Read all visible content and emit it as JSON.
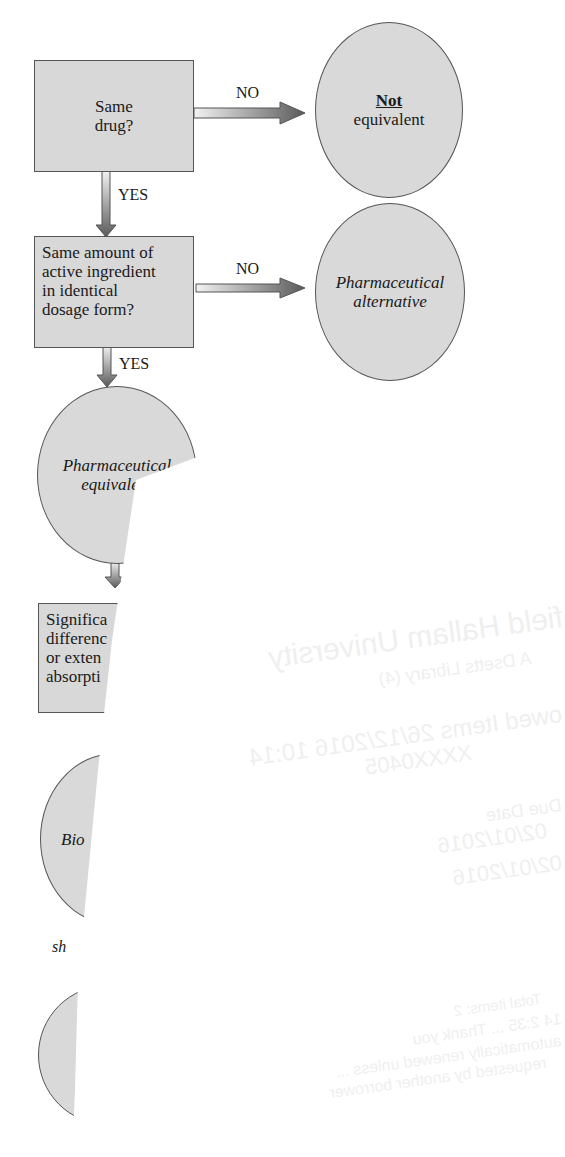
{
  "flowchart": {
    "nodes": {
      "q1": {
        "line1": "Same",
        "line2": "drug?"
      },
      "not_equiv": {
        "bold": "Not",
        "rest": "equivalent"
      },
      "q2": {
        "lines": [
          "Same amount of",
          "active ingredient",
          "in identical",
          "dosage form?"
        ]
      },
      "pharm_alt": {
        "line1": "Pharmaceutical",
        "line2": "alternative"
      },
      "pharm_equiv": {
        "line1": "Pharmaceutical",
        "line2": "equivale"
      },
      "q3": {
        "lines": [
          "Significa",
          "differenc",
          "or exten",
          "absorpti"
        ]
      },
      "bio": {
        "line1": "Bio"
      },
      "partial_caption": "sh"
    },
    "edges": {
      "q1_no": "NO",
      "q1_yes": "YES",
      "q2_no": "NO",
      "q2_yes": "YES"
    }
  },
  "overlay_paper_bleedthrough": {
    "lines": [
      "field Hallam University",
      "A Dsetts Library (4)",
      "owed Items 26/12/2016 10:14",
      "XXXX0405",
      "Due Date",
      "02/01/2016",
      "02/01/2016"
    ],
    "footer_lines": [
      "Total items: 2",
      "14 2:35 ... Thank you",
      "automatically renewed unless ...",
      "requested by another borrower"
    ]
  },
  "colors": {
    "node_fill": "#d8d8d8",
    "node_border": "#555555",
    "arrow_dark": "#555555",
    "arrow_light": "#eeeeee",
    "paper": "#ffffff"
  }
}
